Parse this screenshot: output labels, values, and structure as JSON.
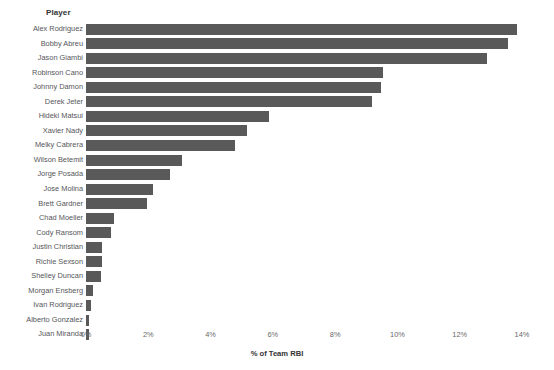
{
  "chart_data": {
    "type": "bar",
    "orientation": "horizontal",
    "title": "",
    "dimension_header": "Player",
    "xlabel": "% of Team RBI",
    "ylabel": "Player",
    "xlim": [
      0,
      14
    ],
    "xticks": [
      "0%",
      "2%",
      "4%",
      "6%",
      "8%",
      "10%",
      "12%",
      "14%"
    ],
    "xtick_values": [
      0,
      2,
      4,
      6,
      8,
      10,
      12,
      14
    ],
    "grid": false,
    "legend": "none",
    "bar_color": "#595959",
    "categories": [
      "Alex Rodriguez",
      "Bobby Abreu",
      "Jason Giambi",
      "Robinson Cano",
      "Johnny Damon",
      "Derek Jeter",
      "Hideki Matsui",
      "Xavier Nady",
      "Melky Cabrera",
      "Wilson Betemit",
      "Jorge Posada",
      "Jose Molina",
      "Brett Gardner",
      "Chad Moeller",
      "Cody Ransom",
      "Justin Christian",
      "Richie Sexson",
      "Shelley Duncan",
      "Morgan Ensberg",
      "Ivan Rodriguez",
      "Alberto Gonzalez",
      "Juan Miranda"
    ],
    "values": [
      13.85,
      13.55,
      12.88,
      9.54,
      9.48,
      9.18,
      5.88,
      5.17,
      4.79,
      3.08,
      2.7,
      2.15,
      1.96,
      0.9,
      0.8,
      0.51,
      0.51,
      0.48,
      0.22,
      0.16,
      0.1,
      0.1
    ]
  }
}
